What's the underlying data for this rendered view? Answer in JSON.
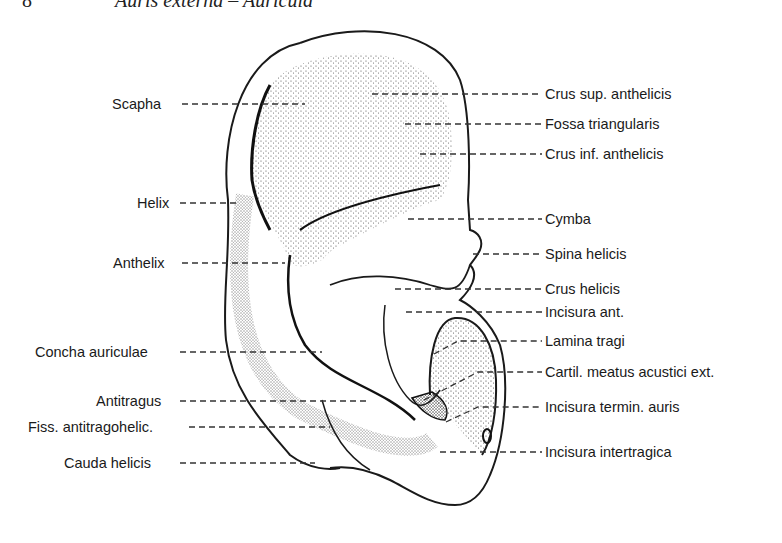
{
  "header": {
    "figure_number": "8",
    "title": "Auris externa – Auricula"
  },
  "labels_left": [
    {
      "text": "Scapha",
      "x": 112,
      "y": 96
    },
    {
      "text": "Helix",
      "x": 137,
      "y": 195
    },
    {
      "text": "Anthelix",
      "x": 113,
      "y": 256
    },
    {
      "text": "Concha auriculae",
      "x": 35,
      "y": 345
    },
    {
      "text": "Antitragus",
      "x": 96,
      "y": 394
    },
    {
      "text": "Fiss. antitragohelic.",
      "x": 28,
      "y": 420
    },
    {
      "text": "Cauda helicis",
      "x": 64,
      "y": 456
    }
  ],
  "labels_right": [
    {
      "text": "Crus sup. anthelicis",
      "x": 545,
      "y": 85
    },
    {
      "text": "Fossa triangularis",
      "x": 545,
      "y": 117
    },
    {
      "text": "Crus inf. anthelicis",
      "x": 545,
      "y": 147
    },
    {
      "text": "Cymba",
      "x": 545,
      "y": 211
    },
    {
      "text": "Spina helicis",
      "x": 545,
      "y": 246
    },
    {
      "text": "Crus helicis",
      "x": 545,
      "y": 281
    },
    {
      "text": "Incisura ant.",
      "x": 545,
      "y": 303
    },
    {
      "text": "Lamina tragi",
      "x": 545,
      "y": 333
    },
    {
      "text": "Cartil. meatus acustici ext.",
      "x": 545,
      "y": 364
    },
    {
      "text": "Incisura termin. auris",
      "x": 545,
      "y": 400
    },
    {
      "text": "Incisura intertragica",
      "x": 545,
      "y": 444
    }
  ],
  "colors": {
    "ink": "#1a1a1a",
    "stipple": "#3a3a3a",
    "leader": "#333333",
    "background": "#ffffff"
  }
}
